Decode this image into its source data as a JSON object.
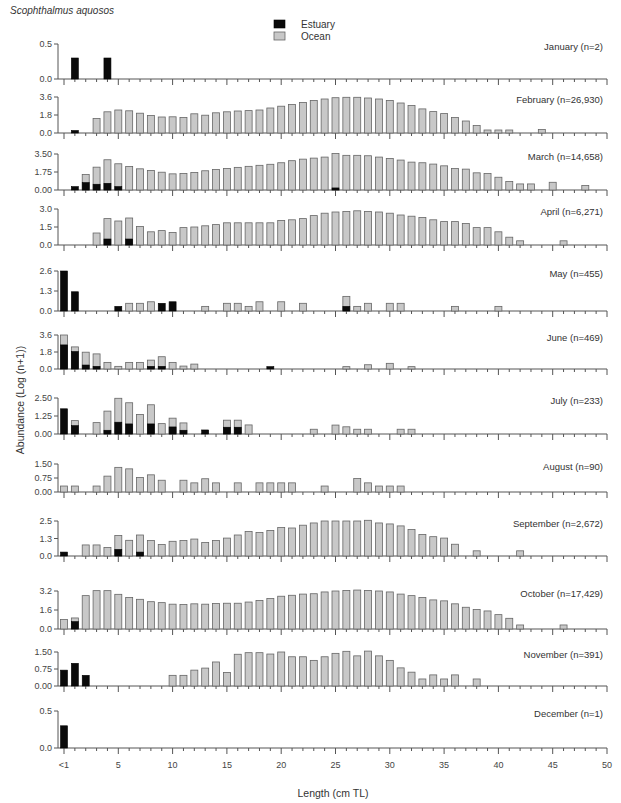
{
  "chart_data": {
    "type": "bar",
    "subtype": "stacked-small-multiples",
    "title": "Scophthalmus aquosos",
    "xlabel": "Length (cm TL)",
    "ylabel": "Abundance (Log (n+1))",
    "x_tick_labels": [
      "<1",
      "5",
      "10",
      "15",
      "20",
      "25",
      "30",
      "35",
      "40",
      "45",
      "50"
    ],
    "x_tick_values": [
      0,
      5,
      10,
      15,
      20,
      25,
      30,
      35,
      40,
      45,
      50
    ],
    "xlim": [
      0,
      50
    ],
    "legend": {
      "placement": "top-center",
      "entries": [
        {
          "name": "Estuary",
          "color": "#0a0a0a"
        },
        {
          "name": "Ocean",
          "color": "#c8c8c8"
        }
      ]
    },
    "note": "Each panel: values are total bar heights (Ocean) and the Estuary portion shown in black at the base, keyed by length bin (cm TL, 0 = '<1').",
    "panels": [
      {
        "month": "January (n=2)",
        "yticks": [
          "0.0",
          "0.5"
        ],
        "ylim": [
          0,
          0.5
        ],
        "ocean": {},
        "estuary": {
          "1": 0.3,
          "4": 0.3
        }
      },
      {
        "month": "February (n=26,930)",
        "yticks": [
          "0.0",
          "1.8",
          "3.6"
        ],
        "ylim": [
          0,
          3.6
        ],
        "ocean": {
          "3": 1.45,
          "4": 2.12,
          "5": 2.3,
          "6": 2.22,
          "7": 1.98,
          "8": 1.75,
          "9": 1.6,
          "10": 1.62,
          "11": 1.56,
          "12": 1.92,
          "13": 1.78,
          "14": 2.02,
          "15": 2.12,
          "16": 2.2,
          "17": 2.24,
          "18": 2.3,
          "19": 2.5,
          "20": 2.68,
          "21": 2.85,
          "22": 3.06,
          "23": 3.26,
          "24": 3.4,
          "25": 3.53,
          "26": 3.57,
          "27": 3.57,
          "28": 3.5,
          "29": 3.4,
          "30": 3.26,
          "31": 3.0,
          "32": 2.75,
          "33": 2.41,
          "34": 2.14,
          "35": 1.94,
          "36": 1.55,
          "37": 1.2,
          "38": 0.75,
          "39": 0.3,
          "40": 0.3,
          "41": 0.3,
          "44": 0.35
        },
        "estuary": {
          "1": 0.25
        }
      },
      {
        "month": "March (n=14,658)",
        "yticks": [
          "0.00",
          "1.75",
          "3.50"
        ],
        "ylim": [
          0,
          3.5
        ],
        "ocean": {
          "2": 1.5,
          "3": 2.22,
          "4": 2.94,
          "5": 2.55,
          "6": 2.29,
          "7": 2.06,
          "8": 1.9,
          "9": 1.73,
          "10": 1.57,
          "11": 1.6,
          "12": 1.7,
          "13": 1.87,
          "14": 2.0,
          "15": 2.1,
          "16": 2.2,
          "17": 2.3,
          "18": 2.4,
          "19": 2.5,
          "20": 2.65,
          "21": 2.85,
          "22": 3.0,
          "23": 3.1,
          "24": 3.2,
          "25": 3.55,
          "26": 3.37,
          "27": 3.37,
          "28": 3.33,
          "29": 3.2,
          "30": 3.07,
          "31": 2.91,
          "32": 2.71,
          "33": 2.65,
          "34": 2.52,
          "35": 2.35,
          "36": 2.09,
          "37": 2.03,
          "38": 1.67,
          "39": 1.6,
          "40": 1.24,
          "41": 0.82,
          "42": 0.59,
          "43": 0.59,
          "45": 0.75,
          "48": 0.43
        },
        "estuary": {
          "1": 0.33,
          "2": 0.72,
          "3": 0.56,
          "4": 0.65,
          "5": 0.33,
          "25": 0.2
        }
      },
      {
        "month": "April (n=6,271)",
        "yticks": [
          "0.0",
          "1.5",
          "3.0"
        ],
        "ylim": [
          0,
          3.0
        ],
        "ocean": {
          "3": 1.0,
          "4": 2.2,
          "5": 2.0,
          "6": 2.25,
          "7": 1.55,
          "8": 1.1,
          "9": 1.2,
          "10": 1.05,
          "11": 1.45,
          "12": 1.5,
          "13": 1.6,
          "14": 1.7,
          "15": 1.85,
          "16": 1.85,
          "17": 1.85,
          "18": 1.85,
          "19": 1.85,
          "20": 2.05,
          "21": 2.1,
          "22": 2.2,
          "23": 2.45,
          "24": 2.65,
          "25": 2.75,
          "26": 2.8,
          "27": 2.85,
          "28": 2.8,
          "29": 2.75,
          "30": 2.65,
          "31": 2.5,
          "32": 2.4,
          "33": 2.3,
          "34": 2.1,
          "35": 1.95,
          "36": 1.95,
          "37": 1.8,
          "38": 1.45,
          "39": 1.45,
          "40": 1.1,
          "41": 0.65,
          "42": 0.35,
          "46": 0.35
        },
        "estuary": {
          "4": 0.5,
          "6": 0.5
        }
      },
      {
        "month": "May (n=455)",
        "yticks": [
          "0.0",
          "1.3",
          "2.6"
        ],
        "ylim": [
          0,
          2.6
        ],
        "ocean": {
          "6": 0.5,
          "7": 0.5,
          "8": 0.6,
          "13": 0.3,
          "15": 0.5,
          "16": 0.5,
          "17": 0.3,
          "18": 0.6,
          "20": 0.6,
          "22": 0.5,
          "26": 0.95,
          "27": 0.3,
          "28": 0.5,
          "30": 0.5,
          "31": 0.5,
          "36": 0.3,
          "40": 0.3
        },
        "estuary": {
          "0": 2.6,
          "1": 1.25,
          "5": 0.3,
          "9": 0.5,
          "10": 0.6,
          "26": 0.3
        }
      },
      {
        "month": "June (n=469)",
        "yticks": [
          "0.0",
          "1.8",
          "3.6"
        ],
        "ylim": [
          0,
          3.6
        ],
        "ocean": {
          "0": 3.6,
          "1": 2.34,
          "2": 1.78,
          "3": 1.6,
          "4": 0.7,
          "5": 0.28,
          "6": 0.7,
          "7": 0.7,
          "8": 0.94,
          "9": 1.3,
          "10": 0.7,
          "11": 0.31,
          "12": 0.52,
          "26": 0.25,
          "28": 0.45,
          "30": 0.6,
          "32": 0.25
        },
        "estuary": {
          "0": 2.55,
          "1": 1.85,
          "2": 0.42,
          "3": 0.28,
          "8": 0.28,
          "9": 0.28,
          "19": 0.25
        }
      },
      {
        "month": "July (n=233)",
        "yticks": [
          "0.00",
          "1.25",
          "2.50"
        ],
        "ylim": [
          0,
          2.5
        ],
        "ocean": {
          "1": 0.93,
          "3": 0.79,
          "4": 1.59,
          "5": 2.48,
          "6": 2.17,
          "7": 1.36,
          "8": 2.03,
          "9": 0.72,
          "10": 1.1,
          "11": 0.77,
          "15": 0.96,
          "16": 0.96,
          "17": 0.63,
          "23": 0.33,
          "25": 0.62,
          "26": 0.5,
          "27": 0.33,
          "28": 0.33,
          "31": 0.33,
          "32": 0.33
        },
        "estuary": {
          "0": 1.75,
          "1": 0.58,
          "4": 0.26,
          "5": 0.82,
          "6": 0.7,
          "8": 0.7,
          "10": 0.49,
          "11": 0.26,
          "13": 0.28,
          "15": 0.47,
          "16": 0.47
        }
      },
      {
        "month": "August (n=90)",
        "yticks": [
          "0.00",
          "0.75",
          "1.50"
        ],
        "ylim": [
          0,
          1.5
        ],
        "ocean": {
          "0": 0.32,
          "1": 0.32,
          "3": 0.32,
          "4": 0.85,
          "5": 1.32,
          "6": 1.24,
          "7": 0.78,
          "8": 0.92,
          "9": 0.63,
          "11": 0.63,
          "12": 0.49,
          "13": 0.71,
          "14": 0.49,
          "16": 0.49,
          "18": 0.49,
          "19": 0.49,
          "20": 0.49,
          "21": 0.49,
          "24": 0.32,
          "27": 0.72,
          "28": 0.49,
          "29": 0.32,
          "30": 0.32,
          "31": 0.32
        },
        "estuary": {}
      },
      {
        "month": "September (n=2,672)",
        "yticks": [
          "0.0",
          "1.3",
          "2.5"
        ],
        "ylim": [
          0,
          2.5
        ],
        "ocean": {
          "2": 0.79,
          "3": 0.79,
          "4": 0.61,
          "5": 1.47,
          "6": 1.12,
          "7": 1.5,
          "8": 1.1,
          "9": 0.82,
          "10": 1.05,
          "11": 1.1,
          "12": 1.21,
          "13": 0.96,
          "14": 1.1,
          "15": 1.28,
          "16": 1.5,
          "17": 1.75,
          "18": 1.68,
          "19": 1.82,
          "20": 2.03,
          "21": 2.0,
          "22": 2.2,
          "23": 2.36,
          "24": 2.5,
          "25": 2.5,
          "26": 2.5,
          "27": 2.5,
          "28": 2.55,
          "29": 2.36,
          "30": 2.29,
          "31": 2.15,
          "32": 1.89,
          "33": 1.54,
          "34": 1.38,
          "35": 1.28,
          "36": 0.84,
          "38": 0.37,
          "42": 0.37
        },
        "estuary": {
          "0": 0.28,
          "5": 0.47,
          "7": 0.28
        }
      },
      {
        "month": "October (n=17,429)",
        "yticks": [
          "0.0",
          "1.6",
          "3.2"
        ],
        "ylim": [
          0,
          3.2
        ],
        "ocean": {
          "0": 0.8,
          "1": 0.93,
          "2": 2.81,
          "3": 3.23,
          "4": 3.23,
          "5": 2.92,
          "6": 2.66,
          "7": 2.5,
          "8": 2.3,
          "9": 2.22,
          "10": 2.09,
          "11": 2.06,
          "12": 2.12,
          "13": 2.09,
          "14": 2.14,
          "15": 2.17,
          "16": 2.17,
          "17": 2.27,
          "18": 2.4,
          "19": 2.56,
          "20": 2.76,
          "21": 2.84,
          "22": 2.94,
          "23": 2.97,
          "24": 3.12,
          "25": 3.2,
          "26": 3.25,
          "27": 3.28,
          "28": 3.25,
          "29": 3.2,
          "30": 3.12,
          "31": 2.94,
          "32": 2.81,
          "33": 2.66,
          "34": 2.45,
          "35": 2.37,
          "36": 2.12,
          "37": 1.83,
          "38": 1.65,
          "39": 1.52,
          "40": 1.21,
          "41": 0.9,
          "42": 0.34,
          "46": 0.34
        },
        "estuary": {
          "1": 0.62
        }
      },
      {
        "month": "November (n=391)",
        "yticks": [
          "0.00",
          "0.75",
          "1.50"
        ],
        "ylim": [
          0,
          1.5
        ],
        "ocean": {
          "10": 0.47,
          "11": 0.47,
          "12": 0.7,
          "13": 0.79,
          "14": 1.06,
          "15": 0.6,
          "16": 1.4,
          "17": 1.47,
          "18": 1.47,
          "19": 1.41,
          "20": 1.5,
          "21": 1.29,
          "22": 1.29,
          "23": 1.13,
          "24": 1.29,
          "25": 1.44,
          "26": 1.53,
          "27": 1.33,
          "28": 1.54,
          "29": 1.33,
          "30": 1.13,
          "31": 0.8,
          "32": 0.61,
          "33": 0.31,
          "34": 0.49,
          "35": 0.31,
          "36": 0.49,
          "38": 0.31
        },
        "estuary": {
          "0": 0.7,
          "1": 1.0,
          "2": 0.47
        }
      },
      {
        "month": "December (n=1)",
        "yticks": [
          "0.0",
          "0.5"
        ],
        "ylim": [
          0,
          0.5
        ],
        "ocean": {},
        "estuary": {
          "0": 0.3
        }
      }
    ]
  }
}
